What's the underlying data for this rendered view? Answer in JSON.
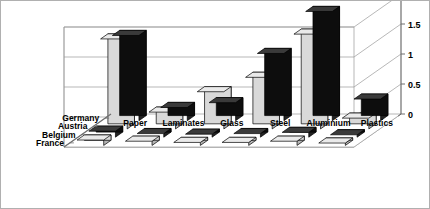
{
  "chart_data": {
    "type": "bar",
    "title": "",
    "subtitle": "",
    "xlabel": "",
    "ylabel": "",
    "projection": "3d-clustered-column",
    "grid": true,
    "legend_position": "depth-axis-left",
    "ylim": [
      0,
      2
    ],
    "yticks": [
      "0",
      "0.5",
      "1",
      "1.5",
      "2"
    ],
    "ytick_values": [
      0,
      0.5,
      1,
      1.5,
      2
    ],
    "categories": [
      "Paper",
      "Laminates",
      "Glass",
      "Steel",
      "Aluminium",
      "Plastics"
    ],
    "series": [
      {
        "name": "Germany",
        "color": "#0d0d0d",
        "values": [
          1.42,
          0.22,
          0.3,
          1.12,
          1.82,
          0.36
        ]
      },
      {
        "name": "Austria",
        "color": "#d9d9d9",
        "values": [
          1.5,
          0.28,
          0.62,
          0.86,
          1.58,
          0.18
        ]
      },
      {
        "name": "Belgium",
        "color": "#0d0d0d",
        "values": [
          0.1,
          0.06,
          0.05,
          0.06,
          0.08,
          0.04
        ]
      },
      {
        "name": "France",
        "color": "#d9d9d9",
        "values": [
          0.09,
          0.07,
          0.05,
          0.05,
          0.07,
          0.04
        ]
      }
    ]
  },
  "axis": {
    "series_labels": [
      "Germany",
      "Austria",
      "Belgium",
      "France"
    ],
    "category_labels": [
      "Paper",
      "Laminates",
      "Glass",
      "Steel",
      "Aluminium",
      "Plastics"
    ],
    "value_labels": [
      "2",
      "1.5",
      "1",
      "0.5",
      "0"
    ]
  },
  "colors": {
    "dark_series": "#0d0d0d",
    "light_series": "#d9d9d9",
    "light_series_shade": "#b5b5b5",
    "light_series_top": "#eaeaea",
    "dark_series_top": "#3a3a3a",
    "dark_series_shade": "#232323",
    "gridline": "#9a9a9a",
    "axis": "#6e6e6e",
    "frame": "#b0b0b0",
    "text": "#000000",
    "background": "#ffffff"
  }
}
